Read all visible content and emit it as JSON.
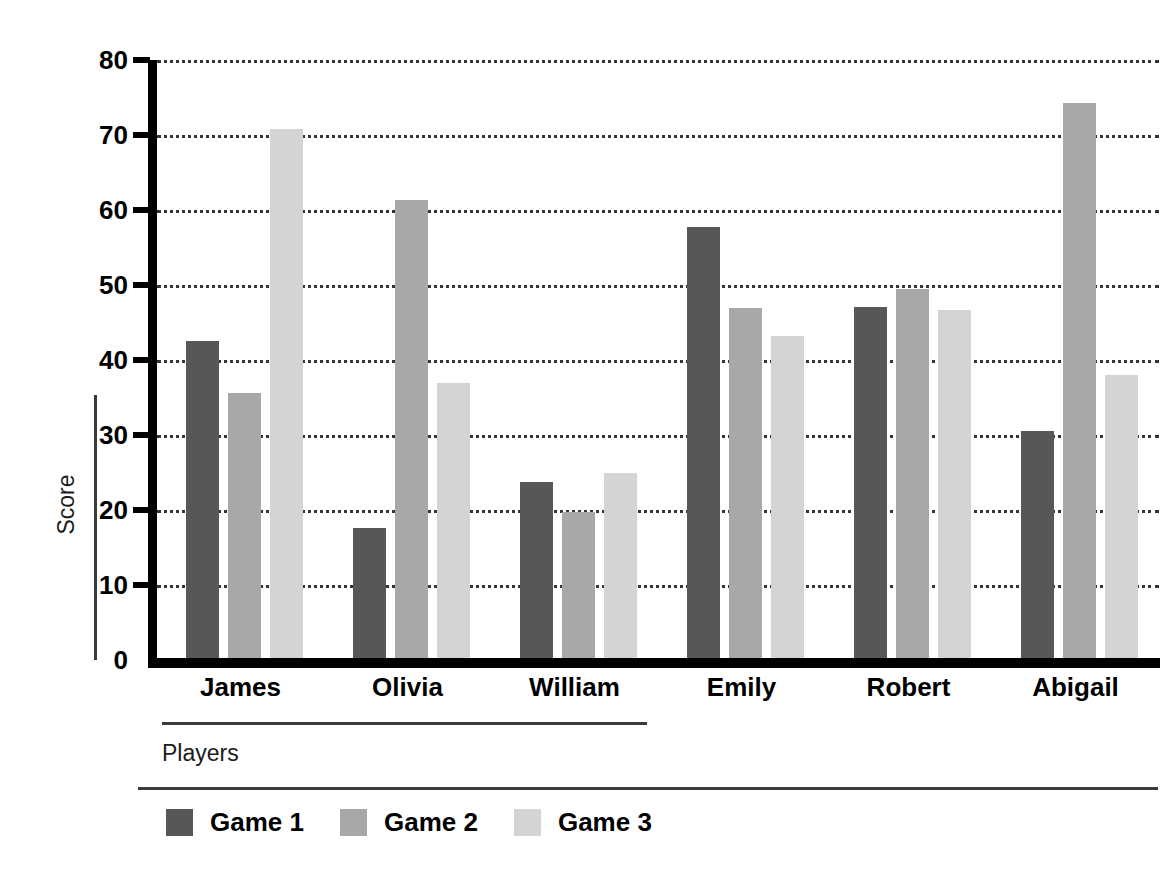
{
  "chart_data": {
    "type": "bar",
    "title": "",
    "subtitle": "",
    "xlabel": "Players",
    "ylabel": "Score",
    "categories": [
      "James",
      "Olivia",
      "William",
      "Emily",
      "Robert",
      "Abigail"
    ],
    "series": [
      {
        "name": "Game 1",
        "color": "#575757",
        "values": [
          42.6,
          17.6,
          23.7,
          57.8,
          47.1,
          30.5
        ]
      },
      {
        "name": "Game 2",
        "color": "#a8a8a8",
        "values": [
          35.6,
          61.4,
          19.7,
          47.0,
          49.5,
          74.3
        ]
      },
      {
        "name": "Game 3",
        "color": "#d4d4d4",
        "values": [
          70.8,
          36.9,
          24.9,
          43.2,
          46.7,
          38.0
        ]
      }
    ],
    "ylim": [
      0,
      80
    ],
    "yticks": [
      0,
      10,
      20,
      30,
      40,
      50,
      60,
      70,
      80
    ],
    "ytick_labels": [
      "0",
      "10",
      "20",
      "30",
      "40",
      "50",
      "60",
      "70",
      "80"
    ],
    "grid": true,
    "grid_style": "dotted",
    "legend_position": "bottom-left",
    "axis_color": "#000000",
    "background_color": "#ffffff"
  },
  "legend": {
    "items": [
      {
        "label": "Game 1",
        "color": "#575757"
      },
      {
        "label": "Game 2",
        "color": "#a8a8a8"
      },
      {
        "label": "Game 3",
        "color": "#d4d4d4"
      }
    ]
  },
  "axes": {
    "y_title": "Score",
    "x_title": "Players"
  }
}
